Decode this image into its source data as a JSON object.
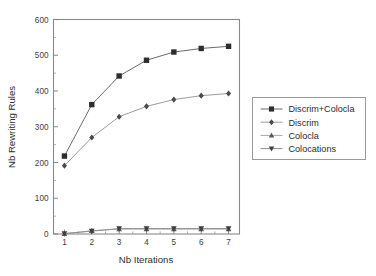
{
  "figure": {
    "background_color": "#ffffff",
    "frame_color": "#8a8a8a",
    "caption_partial": ""
  },
  "chart_data": {
    "type": "line",
    "title": "",
    "subtitle": "",
    "xlabel": "Nb Iterations",
    "ylabel": "Nb Rewriting Rules",
    "x": [
      1,
      2,
      3,
      4,
      5,
      6,
      7
    ],
    "xlim": [
      0.6,
      7.4
    ],
    "ylim": [
      0,
      600
    ],
    "xticks": [
      "1",
      "2",
      "3",
      "4",
      "5",
      "6",
      "7"
    ],
    "yticks": [
      "0",
      "100",
      "200",
      "300",
      "400",
      "500",
      "600"
    ],
    "ytick_values": [
      0,
      100,
      200,
      300,
      400,
      500,
      600
    ],
    "y_minor_interval": 50,
    "grid": false,
    "legend_position": "right-outside",
    "series": [
      {
        "name": "Discrim+Colocla",
        "marker": "square",
        "color": "#2d2d2d",
        "line_color": "#6b6b6b",
        "values": [
          218,
          362,
          442,
          486,
          509,
          519,
          525
        ]
      },
      {
        "name": "Discrim",
        "marker": "diamond",
        "color": "#4a4a4a",
        "line_color": "#9c9c9c",
        "values": [
          191,
          270,
          328,
          357,
          376,
          387,
          393
        ]
      },
      {
        "name": "Colocla",
        "marker": "triangle-up",
        "color": "#595959",
        "line_color": "#a8a8a8",
        "values": [
          1,
          9,
          14,
          14,
          14,
          14,
          14
        ]
      },
      {
        "name": "Colocations",
        "marker": "triangle-down",
        "color": "#3f3f3f",
        "line_color": "#8e8e8e",
        "values": [
          1,
          8,
          15,
          15,
          15,
          15,
          15
        ]
      }
    ]
  },
  "legend": {
    "entries": [
      {
        "label": "Discrim+Colocla",
        "marker": "square"
      },
      {
        "label": "Discrim",
        "marker": "diamond"
      },
      {
        "label": "Colocla",
        "marker": "triangle-up"
      },
      {
        "label": "Colocations",
        "marker": "triangle-down"
      }
    ]
  }
}
